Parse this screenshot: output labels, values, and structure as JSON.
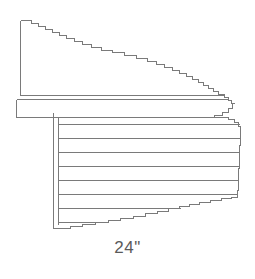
{
  "figure": {
    "kind": "line-drawing",
    "background_color": "#ffffff",
    "line_color": "#7a7a7a",
    "line_color_dark": "#6b6b6b",
    "label_color": "#5a5a5a"
  },
  "annotations": {
    "dimension_label": "24\"",
    "dimension_label_y": 238
  },
  "chart_data": {
    "type": "table",
    "xlabel": "",
    "ylabel": "",
    "parts": [
      {
        "name": "sloped-roof-face",
        "description": "Upper wedge shaped face; flat left vertical edge, stepped diagonal top edge falling left to right, flat bottom at fascia",
        "left_edge_x": 20,
        "top_left_y": 20,
        "bottom_y": 95
      },
      {
        "name": "fascia-band",
        "description": "Horizontal band below sloped face with a thin reveal line at its top",
        "top_y": 96,
        "bottom_y": 117,
        "left_x": 16,
        "right_x": 232
      },
      {
        "name": "corner-post",
        "description": "Narrow vertical double-line post descending from fascia to bottom left of siding",
        "x_left": 53,
        "x_right": 58,
        "top_y": 112,
        "bottom_y": 228
      },
      {
        "name": "siding-panel",
        "description": "Lower panel filled with horizontal siding course lines, right edge near vertical, bottom edge rising to the right",
        "left_x": 58,
        "right_x": 240,
        "top_y": 117,
        "bottom_y": 228
      }
    ],
    "siding_course_lines_y": [
      124,
      138,
      152,
      166,
      180,
      194,
      208,
      222
    ],
    "siding_course_count": 8,
    "dimension_annotations": [
      {
        "label": "24\"",
        "measures": "overall width"
      }
    ]
  }
}
